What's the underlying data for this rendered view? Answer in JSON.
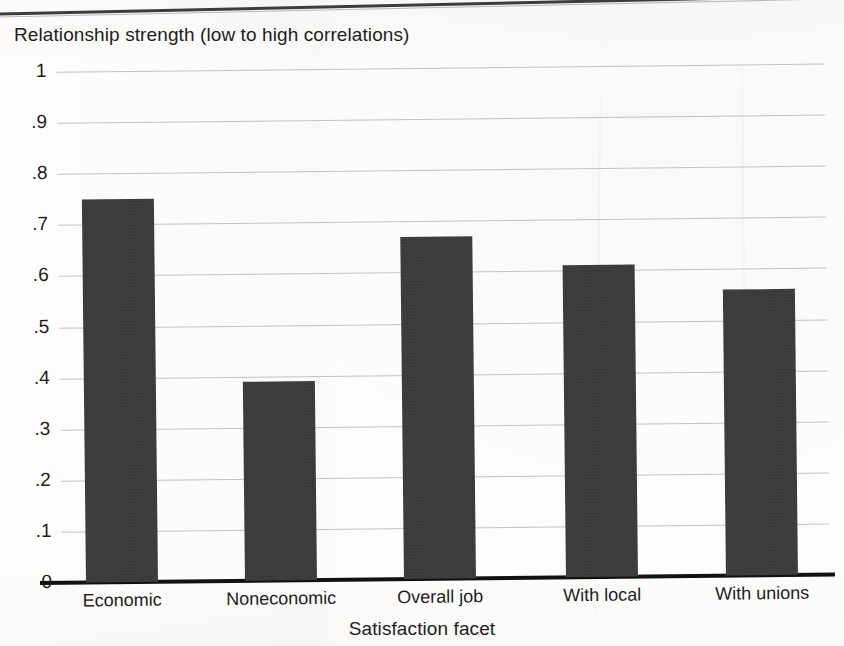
{
  "figure": {
    "background_color": "#fdfdfb",
    "bar_color": "#3b3b3b",
    "gridline_color": "#b9b9b9",
    "axis_color": "#111111",
    "text_color": "#1d1d1d"
  },
  "chart_data": {
    "type": "bar",
    "title": "",
    "ylabel": "Relationship strength (low to high correlations)",
    "xlabel": "Satisfaction facet",
    "categories": [
      "Economic",
      "Noneconomic",
      "Overall job",
      "With local",
      "With unions"
    ],
    "values": [
      0.75,
      0.39,
      0.67,
      0.61,
      0.56
    ],
    "ylim": [
      0,
      1
    ],
    "ytick_values": [
      1,
      0.9,
      0.8,
      0.7,
      0.6,
      0.5,
      0.4,
      0.3,
      0.2,
      0.1,
      0
    ],
    "ytick_labels": [
      "1",
      ".9",
      ".8",
      ".7",
      ".6",
      ".5",
      ".4",
      ".3",
      ".2",
      ".1",
      "0"
    ],
    "grid": true,
    "grid_axis": "y",
    "legend": false,
    "legend_position": "none",
    "series": [
      {
        "name": "Relationship strength",
        "values": [
          0.75,
          0.39,
          0.67,
          0.61,
          0.56
        ]
      }
    ]
  }
}
